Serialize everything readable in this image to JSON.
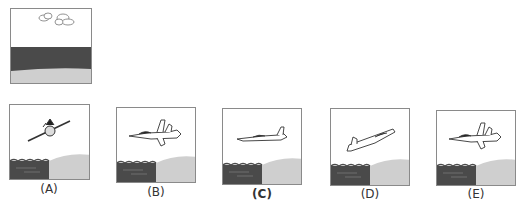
{
  "question": {
    "reference_panel": {
      "description": "sky with clouds over dark sea band and light ground strip",
      "colors": {
        "sky": "#ffffff",
        "sea": "#4a4a4a",
        "ground": "#cfcfcf"
      }
    },
    "options": [
      {
        "label": "(A)",
        "aircraft_view": "front-banked",
        "bold": false
      },
      {
        "label": "(B)",
        "aircraft_view": "side-level",
        "bold": false
      },
      {
        "label": "(C)",
        "aircraft_view": "side-level-small",
        "bold": true
      },
      {
        "label": "(D)",
        "aircraft_view": "side-climbing",
        "bold": false
      },
      {
        "label": "(E)",
        "aircraft_view": "side-level",
        "bold": false
      }
    ],
    "colors": {
      "border": "#8a8a8a",
      "sea": "#4a4a4a",
      "land": "#cfcfcf",
      "ink": "#333333"
    }
  }
}
